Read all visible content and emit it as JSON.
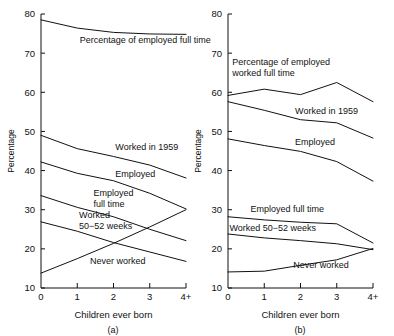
{
  "figure": {
    "width": 394,
    "height": 336,
    "background": "#ffffff",
    "line_color": "#111111"
  },
  "chart_data": [
    {
      "type": "line",
      "panel": "a",
      "caption": "(a)",
      "title": "",
      "xlabel": "Children ever born",
      "ylabel": "Percentage",
      "categories": [
        "0",
        "1",
        "2",
        "3",
        "4+"
      ],
      "x": [
        0,
        1,
        2,
        3,
        4
      ],
      "xlim": [
        0,
        4
      ],
      "ylim": [
        10,
        80
      ],
      "ytick_labels": [
        "10",
        "20",
        "30",
        "40",
        "50",
        "60",
        "70",
        "80"
      ],
      "yticks": [
        10,
        20,
        30,
        40,
        50,
        60,
        70,
        80
      ],
      "grid": false,
      "legend_position": "inline-annotations",
      "series": [
        {
          "name": "Percentage of employed full time",
          "label": "Percentage of employed full time",
          "label_x": 1.07,
          "label_y": 72.5,
          "values": [
            78.5,
            76.4,
            75.3,
            74.9,
            74.8
          ]
        },
        {
          "name": "Worked in 1959",
          "label": "Worked in 1959",
          "label_x": 2.05,
          "label_y": 45.2,
          "values": [
            49.0,
            45.6,
            43.6,
            41.4,
            38.1
          ]
        },
        {
          "name": "Employed",
          "label": "Employed",
          "label_x": 2.05,
          "label_y": 38.4,
          "values": [
            42.2,
            39.3,
            37.4,
            34.2,
            30.2
          ]
        },
        {
          "name": "Employed full time",
          "label": "Employed\nfull time",
          "label_x": 1.45,
          "label_y": 33.4,
          "values": [
            33.6,
            30.6,
            28.2,
            25.0,
            22.1
          ]
        },
        {
          "name": "Worked 50-52 weeks",
          "label": "Worked\n50−52 weeks",
          "label_x": 1.05,
          "label_y": 28.0,
          "values": [
            26.9,
            24.5,
            21.6,
            19.2,
            16.8
          ]
        },
        {
          "name": "Never worked",
          "label": "Never worked",
          "label_x": 1.35,
          "label_y": 16.2,
          "values": [
            13.8,
            17.5,
            21.4,
            25.6,
            30.0
          ]
        }
      ]
    },
    {
      "type": "line",
      "panel": "b",
      "caption": "(b)",
      "title": "",
      "xlabel": "Children ever born",
      "ylabel": "Percentage",
      "categories": [
        "0",
        "1",
        "2",
        "3",
        "4+"
      ],
      "x": [
        0,
        1,
        2,
        3,
        4
      ],
      "xlim": [
        0,
        4
      ],
      "ylim": [
        10,
        80
      ],
      "ytick_labels": [
        "10",
        "20",
        "30",
        "40",
        "50",
        "60",
        "70",
        "80"
      ],
      "yticks": [
        10,
        20,
        30,
        40,
        50,
        60,
        70,
        80
      ],
      "grid": false,
      "legend_position": "inline-annotations",
      "series": [
        {
          "name": "Percentage of employed worked full time",
          "label": "Percentage of employed\nworked full time",
          "label_x": 0.12,
          "label_y": 67.0,
          "values": [
            59.2,
            60.8,
            59.4,
            62.5,
            57.6
          ]
        },
        {
          "name": "Worked in 1959",
          "label": "Worked in 1959",
          "label_x": 1.85,
          "label_y": 54.4,
          "values": [
            57.6,
            55.4,
            53.0,
            52.2,
            48.3
          ]
        },
        {
          "name": "Employed",
          "label": "Employed",
          "label_x": 1.85,
          "label_y": 46.6,
          "values": [
            48.1,
            46.4,
            44.9,
            42.3,
            37.3
          ]
        },
        {
          "name": "Employed full time",
          "label": "Employed full time",
          "label_x": 0.62,
          "label_y": 29.4,
          "values": [
            28.2,
            27.4,
            26.8,
            26.4,
            21.5
          ]
        },
        {
          "name": "Worked 50-52 weeks",
          "label": "Worked 50−52 weeks",
          "label_x": 0.04,
          "label_y": 24.6,
          "values": [
            23.8,
            22.8,
            22.1,
            21.3,
            19.8
          ]
        },
        {
          "name": "Never worked",
          "label": "Never worked",
          "label_x": 1.8,
          "label_y": 15.0,
          "values": [
            14.1,
            14.3,
            15.8,
            17.2,
            20.1
          ]
        }
      ]
    }
  ]
}
